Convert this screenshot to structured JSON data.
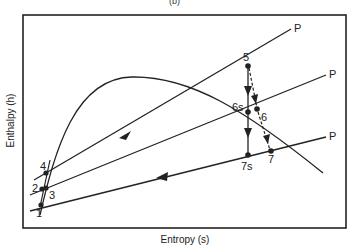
{
  "figure": {
    "title": "(b)",
    "xlabel": "Entropy (s)",
    "ylabel": "Enthalpy (h)"
  },
  "points": {
    "p1": "1",
    "p2": "2",
    "p3": "3",
    "p4": "4",
    "p5": "5",
    "p6": "6",
    "p6s": "6s",
    "p7": "7",
    "p7s": "7s"
  },
  "isobars": {
    "label_high": "P",
    "label_mid": "P",
    "label_low": "P"
  },
  "colors": {
    "line": "#222222",
    "background": "#ffffff"
  }
}
